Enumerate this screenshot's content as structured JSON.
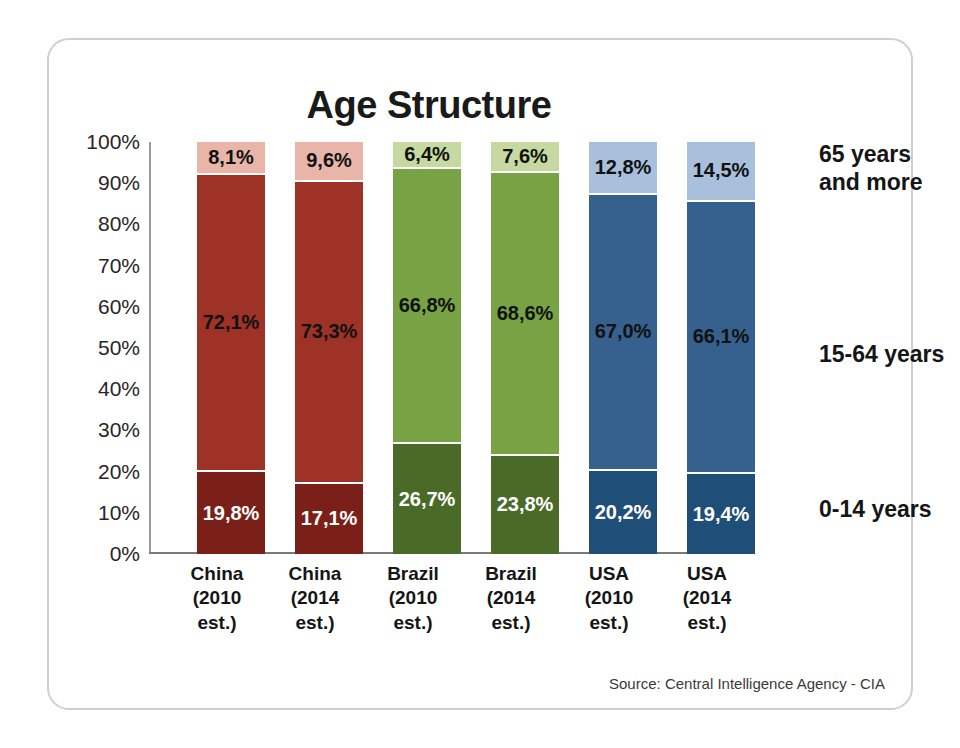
{
  "card": {
    "title": "Age Structure",
    "source": "Source: Central Intelligence Agency - CIA"
  },
  "legend": [
    {
      "label_line1": "65 years",
      "label_line2": "and more"
    },
    {
      "label_line1": "15-64 years",
      "label_line2": ""
    },
    {
      "label_line1": "0-14 years",
      "label_line2": ""
    }
  ],
  "axis": {
    "yticks": [
      "100%",
      "90%",
      "80%",
      "70%",
      "60%",
      "50%",
      "40%",
      "30%",
      "20%",
      "10%",
      "0%"
    ]
  },
  "categories": [
    {
      "line1": "China",
      "line2": "(2010",
      "line3": "est.)"
    },
    {
      "line1": "China",
      "line2": "(2014",
      "line3": "est.)"
    },
    {
      "line1": "Brazil",
      "line2": "(2010",
      "line3": "est.)"
    },
    {
      "line1": "Brazil",
      "line2": "(2014",
      "line3": "est.)"
    },
    {
      "line1": "USA",
      "line2": "(2010",
      "line3": "est.)"
    },
    {
      "line1": "USA",
      "line2": "(2014",
      "line3": "est.)"
    }
  ],
  "bars": [
    {
      "name": "china-2010",
      "bottom": {
        "label": "19,8%",
        "value": 19.8,
        "color": "#7A2018",
        "text": "light"
      },
      "middle": {
        "label": "72,1%",
        "value": 72.1,
        "color": "#9E3226",
        "text": "dark"
      },
      "top": {
        "label": "8,1%",
        "value": 8.1,
        "color": "#E8B5A8",
        "text": "dark"
      }
    },
    {
      "name": "china-2014",
      "bottom": {
        "label": "17,1%",
        "value": 17.1,
        "color": "#7A2018",
        "text": "light"
      },
      "middle": {
        "label": "73,3%",
        "value": 73.3,
        "color": "#9E3226",
        "text": "dark"
      },
      "top": {
        "label": "9,6%",
        "value": 9.6,
        "color": "#E8B5A8",
        "text": "dark"
      }
    },
    {
      "name": "brazil-2010",
      "bottom": {
        "label": "26,7%",
        "value": 26.7,
        "color": "#4A6B28",
        "text": "light"
      },
      "middle": {
        "label": "66,8%",
        "value": 66.8,
        "color": "#77A344",
        "text": "dark"
      },
      "top": {
        "label": "6,4%",
        "value": 6.4,
        "color": "#C5D9A0",
        "text": "dark"
      }
    },
    {
      "name": "brazil-2014",
      "bottom": {
        "label": "23,8%",
        "value": 23.8,
        "color": "#4A6B28",
        "text": "light"
      },
      "middle": {
        "label": "68,6%",
        "value": 68.6,
        "color": "#77A344",
        "text": "dark"
      },
      "top": {
        "label": "7,6%",
        "value": 7.6,
        "color": "#C5D9A0",
        "text": "dark"
      }
    },
    {
      "name": "usa-2010",
      "bottom": {
        "label": "20,2%",
        "value": 20.2,
        "color": "#1F4E79",
        "text": "light"
      },
      "middle": {
        "label": "67,0%",
        "value": 67.0,
        "color": "#36618E",
        "text": "dark"
      },
      "top": {
        "label": "12,8%",
        "value": 12.8,
        "color": "#A8C0DC",
        "text": "dark"
      }
    },
    {
      "name": "usa-2014",
      "bottom": {
        "label": "19,4%",
        "value": 19.4,
        "color": "#1F4E79",
        "text": "light"
      },
      "middle": {
        "label": "66,1%",
        "value": 66.1,
        "color": "#36618E",
        "text": "dark"
      },
      "top": {
        "label": "14,5%",
        "value": 14.5,
        "color": "#A8C0DC",
        "text": "dark"
      }
    }
  ],
  "chart_data": {
    "type": "bar",
    "subtype": "stacked-100-percent",
    "title": "Age Structure",
    "xlabel": "",
    "ylabel": "",
    "ylim": [
      0,
      100
    ],
    "grid": false,
    "legend_position": "right",
    "source": "Source: Central Intelligence Agency - CIA",
    "categories": [
      "China (2010 est.)",
      "China (2014 est.)",
      "Brazil (2010 est.)",
      "Brazil (2014 est.)",
      "USA (2010 est.)",
      "USA (2014 est.)"
    ],
    "ytick_labels": [
      "0%",
      "10%",
      "20%",
      "30%",
      "40%",
      "50%",
      "60%",
      "70%",
      "80%",
      "90%",
      "100%"
    ],
    "series": [
      {
        "name": "0-14 years",
        "values": [
          19.8,
          17.1,
          26.7,
          23.8,
          20.2,
          19.4
        ],
        "labels": [
          "19,8%",
          "17,1%",
          "26,7%",
          "23,8%",
          "20,2%",
          "19,4%"
        ],
        "colors": [
          "#7A2018",
          "#7A2018",
          "#4A6B28",
          "#4A6B28",
          "#1F4E79",
          "#1F4E79"
        ]
      },
      {
        "name": "15-64 years",
        "values": [
          72.1,
          73.3,
          66.8,
          68.6,
          67.0,
          66.1
        ],
        "labels": [
          "72,1%",
          "73,3%",
          "66,8%",
          "68,6%",
          "67,0%",
          "66,1%"
        ],
        "colors": [
          "#9E3226",
          "#9E3226",
          "#77A344",
          "#77A344",
          "#36618E",
          "#36618E"
        ]
      },
      {
        "name": "65 years and more",
        "values": [
          8.1,
          9.6,
          6.4,
          7.6,
          12.8,
          14.5
        ],
        "labels": [
          "8,1%",
          "9,6%",
          "6,4%",
          "7,6%",
          "12,8%",
          "14,5%"
        ],
        "colors": [
          "#E8B5A8",
          "#E8B5A8",
          "#C5D9A0",
          "#C5D9A0",
          "#A8C0DC",
          "#A8C0DC"
        ]
      }
    ]
  }
}
